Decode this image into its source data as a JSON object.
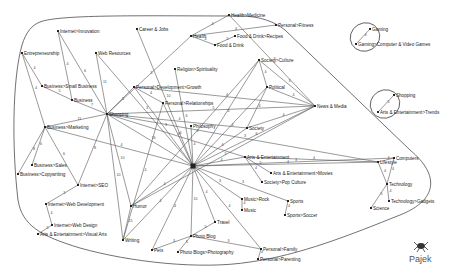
{
  "app": {
    "name": "Pajek",
    "logo_icon": "spider-icon"
  },
  "graph": {
    "nodes": [
      {
        "id": "shopping_hub",
        "label": "Shopping",
        "x": 107,
        "y": 114
      },
      {
        "id": "hub",
        "label": "",
        "x": 193,
        "y": 166
      },
      {
        "id": "internet_innovation",
        "label": "Internet>Innovation",
        "x": 58,
        "y": 31
      },
      {
        "id": "entrepreneurship",
        "label": "Entrepreneurship",
        "x": 22,
        "y": 53
      },
      {
        "id": "web_resources",
        "label": "Web Resources",
        "x": 96,
        "y": 53
      },
      {
        "id": "career_jobs",
        "label": "Career & Jobs",
        "x": 137,
        "y": 29
      },
      {
        "id": "business_small",
        "label": "Business>Small Business",
        "x": 42,
        "y": 86
      },
      {
        "id": "business",
        "label": "Business",
        "x": 72,
        "y": 100
      },
      {
        "id": "business_marketing",
        "label": "Business>Marketing",
        "x": 45,
        "y": 127
      },
      {
        "id": "business_sales",
        "label": "Business>Sales",
        "x": 32,
        "y": 165
      },
      {
        "id": "business_copywriting",
        "label": "Business>Copywriting",
        "x": 18,
        "y": 174
      },
      {
        "id": "internet_seo",
        "label": "Internet>SEO",
        "x": 78,
        "y": 185
      },
      {
        "id": "internet_webdev",
        "label": "Internet>Web Development",
        "x": 46,
        "y": 204
      },
      {
        "id": "internet_webdesign",
        "label": "Internet>Web Design",
        "x": 52,
        "y": 225
      },
      {
        "id": "arts_visual",
        "label": "Arts & Entertainment>Visual Arts",
        "x": 38,
        "y": 234
      },
      {
        "id": "health_medicine",
        "label": "Health>Medicine",
        "x": 229,
        "y": 15
      },
      {
        "id": "personal_fitness",
        "label": "Personal>Fitness",
        "x": 276,
        "y": 25
      },
      {
        "id": "health",
        "label": "Health",
        "x": 191,
        "y": 36
      },
      {
        "id": "food_recipes",
        "label": "Food & Drink>Recipes",
        "x": 235,
        "y": 36
      },
      {
        "id": "food_drink",
        "label": "Food & Drink",
        "x": 215,
        "y": 45
      },
      {
        "id": "religion",
        "label": "Religion>Spirituality",
        "x": 175,
        "y": 69
      },
      {
        "id": "personal_dev",
        "label": "Personal>Development>Growth",
        "x": 134,
        "y": 87
      },
      {
        "id": "personal_rel",
        "label": "Personal>Relationships",
        "x": 163,
        "y": 103
      },
      {
        "id": "society_culture",
        "label": "Society>Culture",
        "x": 259,
        "y": 60
      },
      {
        "id": "political",
        "label": "Political",
        "x": 267,
        "y": 87
      },
      {
        "id": "news_media",
        "label": "News & Media",
        "x": 315,
        "y": 106
      },
      {
        "id": "philosophy",
        "label": "Philosophy",
        "x": 191,
        "y": 126
      },
      {
        "id": "society",
        "label": "Society",
        "x": 247,
        "y": 128
      },
      {
        "id": "arts_ent",
        "label": "Arts & Entertainment",
        "x": 245,
        "y": 157
      },
      {
        "id": "arts_movies",
        "label": "Arts & Entertainment>Movies",
        "x": 271,
        "y": 173
      },
      {
        "id": "society_pop",
        "label": "Society>Pop Culture",
        "x": 262,
        "y": 182
      },
      {
        "id": "music_rock",
        "label": "Music>Rock",
        "x": 242,
        "y": 199
      },
      {
        "id": "music",
        "label": "Music",
        "x": 242,
        "y": 210
      },
      {
        "id": "sports",
        "label": "Sports",
        "x": 288,
        "y": 201
      },
      {
        "id": "sports_soccer",
        "label": "Sports>Soccer",
        "x": 285,
        "y": 215
      },
      {
        "id": "humor",
        "label": "Humor",
        "x": 131,
        "y": 206
      },
      {
        "id": "writing",
        "label": "Writing",
        "x": 123,
        "y": 240
      },
      {
        "id": "travel",
        "label": "Travel",
        "x": 215,
        "y": 222
      },
      {
        "id": "photo_blog",
        "label": "Photo Blog",
        "x": 191,
        "y": 236
      },
      {
        "id": "photo_blogs_photography",
        "label": "Photo Blogs>Photography",
        "x": 178,
        "y": 252
      },
      {
        "id": "pets",
        "label": "Pets",
        "x": 152,
        "y": 250
      },
      {
        "id": "personal_family",
        "label": "Personal>Family",
        "x": 261,
        "y": 249
      },
      {
        "id": "personal_parenting",
        "label": "Personal>Parenting",
        "x": 258,
        "y": 259
      },
      {
        "id": "gaming",
        "label": "Gaming",
        "x": 370,
        "y": 29
      },
      {
        "id": "gaming_cv",
        "label": "Gaming>Computer & Video Games",
        "x": 356,
        "y": 44
      },
      {
        "id": "shopping2",
        "label": "Shopping",
        "x": 394,
        "y": 95
      },
      {
        "id": "arts_trends",
        "label": "Arts & Entertainment>Trends",
        "x": 378,
        "y": 112
      },
      {
        "id": "computers",
        "label": "Computers",
        "x": 394,
        "y": 158
      },
      {
        "id": "lifestyle",
        "label": "Lifestyle",
        "x": 378,
        "y": 162
      },
      {
        "id": "technology",
        "label": "Technology",
        "x": 387,
        "y": 184
      },
      {
        "id": "science",
        "label": "Science",
        "x": 371,
        "y": 208
      },
      {
        "id": "tech_gadgets",
        "label": "Technology>Gadgets",
        "x": 389,
        "y": 201
      }
    ],
    "edges": [
      {
        "s": "internet_innovation",
        "t": "shopping_hub",
        "w": "6"
      },
      {
        "s": "internet_innovation",
        "t": "business",
        "w": "4"
      },
      {
        "s": "entrepreneurship",
        "t": "business_small",
        "w": "4"
      },
      {
        "s": "entrepreneurship",
        "t": "business_marketing",
        "w": "4"
      },
      {
        "s": "web_resources",
        "t": "shopping_hub",
        "w": "11"
      },
      {
        "s": "web_resources",
        "t": "hub",
        "w": "3"
      },
      {
        "s": "career_jobs",
        "t": "hub",
        "w": "10"
      },
      {
        "s": "business_small",
        "t": "business",
        "w": "5"
      },
      {
        "s": "business",
        "t": "shopping_hub",
        "w": "7"
      },
      {
        "s": "business_marketing",
        "t": "shopping_hub",
        "w": "11"
      },
      {
        "s": "business_marketing",
        "t": "business_sales",
        "w": "6"
      },
      {
        "s": "business_marketing",
        "t": "business_copywriting",
        "w": "8"
      },
      {
        "s": "business_marketing",
        "t": "internet_seo",
        "w": "6"
      },
      {
        "s": "internet_seo",
        "t": "shopping_hub",
        "w": "8"
      },
      {
        "s": "internet_seo",
        "t": "internet_webdev",
        "w": "5"
      },
      {
        "s": "internet_webdev",
        "t": "internet_webdesign",
        "w": "4"
      },
      {
        "s": "internet_webdesign",
        "t": "arts_visual",
        "w": "5"
      },
      {
        "s": "shopping_hub",
        "t": "personal_dev",
        "w": "5"
      },
      {
        "s": "shopping_hub",
        "t": "hub",
        "w": "16"
      },
      {
        "s": "shopping_hub",
        "t": "news_media",
        "w": "5"
      },
      {
        "s": "shopping_hub",
        "t": "society",
        "w": "4"
      },
      {
        "s": "shopping_hub",
        "t": "lifestyle",
        "w": "3"
      },
      {
        "s": "shopping_hub",
        "t": "humor",
        "w": "10"
      },
      {
        "s": "shopping_hub",
        "t": "writing",
        "w": "10"
      },
      {
        "s": "shopping_hub",
        "t": "arts_ent",
        "w": "4"
      },
      {
        "s": "health",
        "t": "health_medicine",
        "w": "4"
      },
      {
        "s": "health",
        "t": "personal_fitness",
        "w": "4"
      },
      {
        "s": "health",
        "t": "food_drink",
        "w": "4"
      },
      {
        "s": "food_drink",
        "t": "food_recipes",
        "w": "5"
      },
      {
        "s": "health",
        "t": "shopping_hub",
        "w": "5"
      },
      {
        "s": "health_medicine",
        "t": "news_media",
        "w": "3"
      },
      {
        "s": "religion",
        "t": "hub",
        "w": "6"
      },
      {
        "s": "personal_dev",
        "t": "personal_rel",
        "w": "4"
      },
      {
        "s": "personal_dev",
        "t": "hub",
        "w": "3"
      },
      {
        "s": "personal_dev",
        "t": "news_media",
        "w": "4"
      },
      {
        "s": "personal_rel",
        "t": "hub",
        "w": "4"
      },
      {
        "s": "personal_rel",
        "t": "writing",
        "w": "4"
      },
      {
        "s": "society_culture",
        "t": "political",
        "w": "4"
      },
      {
        "s": "society_culture",
        "t": "news_media",
        "w": "3"
      },
      {
        "s": "society_culture",
        "t": "hub",
        "w": "4"
      },
      {
        "s": "society_culture",
        "t": "humor",
        "w": "3"
      },
      {
        "s": "political",
        "t": "news_media",
        "w": "4"
      },
      {
        "s": "political",
        "t": "hub",
        "w": "4"
      },
      {
        "s": "political",
        "t": "society",
        "w": "4"
      },
      {
        "s": "news_media",
        "t": "hub",
        "w": "6"
      },
      {
        "s": "news_media",
        "t": "society",
        "w": "4"
      },
      {
        "s": "news_media",
        "t": "humor",
        "w": "5"
      },
      {
        "s": "philosophy",
        "t": "hub",
        "w": "4"
      },
      {
        "s": "society",
        "t": "hub",
        "w": "4"
      },
      {
        "s": "arts_ent",
        "t": "arts_movies",
        "w": "5"
      },
      {
        "s": "arts_ent",
        "t": "society_pop",
        "w": "4"
      },
      {
        "s": "arts_ent",
        "t": "hub",
        "w": "4"
      },
      {
        "s": "arts_ent",
        "t": "lifestyle",
        "w": "4"
      },
      {
        "s": "hub",
        "t": "lifestyle",
        "w": "4"
      },
      {
        "s": "hub",
        "t": "computers",
        "w": "3"
      },
      {
        "s": "hub",
        "t": "music_rock",
        "w": "3"
      },
      {
        "s": "hub",
        "t": "sports",
        "w": "3"
      },
      {
        "s": "hub",
        "t": "travel",
        "w": "4"
      },
      {
        "s": "hub",
        "t": "photo_blog",
        "w": "10"
      },
      {
        "s": "hub",
        "t": "pets",
        "w": "4"
      },
      {
        "s": "hub",
        "t": "humor",
        "w": "4"
      },
      {
        "s": "hub",
        "t": "writing",
        "w": "4"
      },
      {
        "s": "hub",
        "t": "personal_family",
        "w": "4"
      },
      {
        "s": "hub",
        "t": "business_marketing",
        "w": "4"
      },
      {
        "s": "music_rock",
        "t": "music",
        "w": "4"
      },
      {
        "s": "sports",
        "t": "sports_soccer",
        "w": "4"
      },
      {
        "s": "humor",
        "t": "writing",
        "w": "15"
      },
      {
        "s": "photo_blog",
        "t": "travel",
        "w": "5"
      },
      {
        "s": "photo_blog",
        "t": "pets",
        "w": "3"
      },
      {
        "s": "photo_blog",
        "t": "photo_blogs_photography",
        "w": "5"
      },
      {
        "s": "photo_blog",
        "t": "personal_family",
        "w": "3"
      },
      {
        "s": "personal_family",
        "t": "personal_parenting",
        "w": "4"
      },
      {
        "s": "gaming",
        "t": "gaming_cv",
        "w": "4"
      },
      {
        "s": "shopping2",
        "t": "arts_trends",
        "w": "5"
      },
      {
        "s": "lifestyle",
        "t": "computers",
        "w": "4"
      },
      {
        "s": "lifestyle",
        "t": "technology",
        "w": "4"
      },
      {
        "s": "computers",
        "t": "technology",
        "w": "4"
      },
      {
        "s": "technology",
        "t": "science",
        "w": "5"
      },
      {
        "s": "technology",
        "t": "tech_gadgets",
        "w": "4"
      }
    ]
  }
}
